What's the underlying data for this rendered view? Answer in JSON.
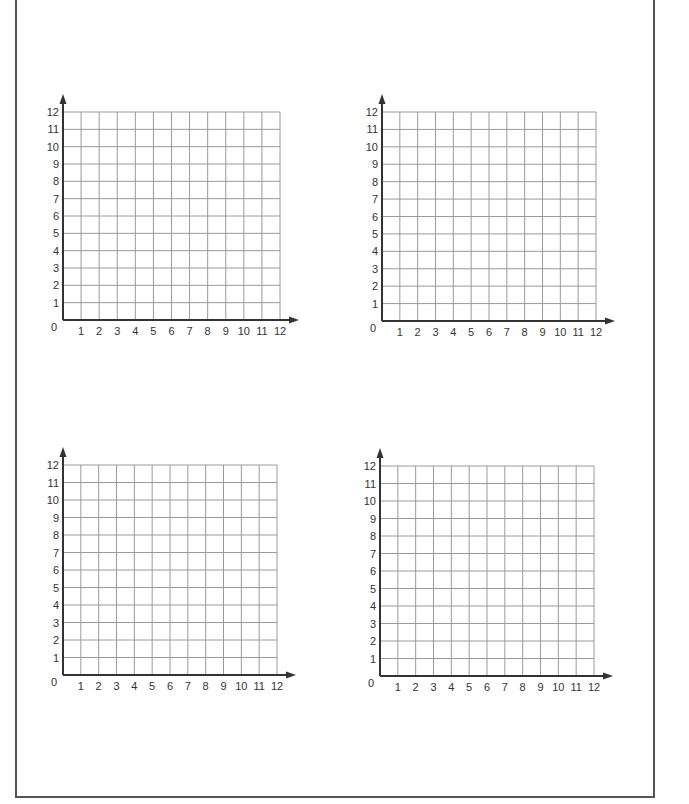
{
  "worksheet": {
    "grid_count": 4,
    "colors": {
      "grid_line": "#9a9a9a",
      "axis": "#333333",
      "frame": "#555555",
      "label": "#333333"
    },
    "grids": [
      {
        "id": "top-left",
        "origin_x": 63,
        "origin_y": 320,
        "width": 217,
        "height": 208,
        "x_labels": [
          "1",
          "2",
          "3",
          "4",
          "5",
          "6",
          "7",
          "8",
          "9",
          "10",
          "11",
          "12"
        ],
        "y_labels": [
          "1",
          "2",
          "3",
          "4",
          "5",
          "6",
          "7",
          "8",
          "9",
          "10",
          "11",
          "12"
        ],
        "origin_label": "0"
      },
      {
        "id": "top-right",
        "origin_x": 382,
        "origin_y": 321,
        "width": 214,
        "height": 209,
        "x_labels": [
          "1",
          "2",
          "3",
          "4",
          "5",
          "6",
          "7",
          "8",
          "9",
          "10",
          "11",
          "12"
        ],
        "y_labels": [
          "1",
          "2",
          "3",
          "4",
          "5",
          "6",
          "7",
          "8",
          "9",
          "10",
          "11",
          "12"
        ],
        "origin_label": "0"
      },
      {
        "id": "bottom-left",
        "origin_x": 63,
        "origin_y": 675,
        "width": 214,
        "height": 210,
        "x_labels": [
          "1",
          "2",
          "3",
          "4",
          "5",
          "6",
          "7",
          "8",
          "9",
          "10",
          "11",
          "12"
        ],
        "y_labels": [
          "1",
          "2",
          "3",
          "4",
          "5",
          "6",
          "7",
          "8",
          "9",
          "10",
          "11",
          "12"
        ],
        "origin_label": "0"
      },
      {
        "id": "bottom-right",
        "origin_x": 380,
        "origin_y": 676,
        "width": 214,
        "height": 210,
        "x_labels": [
          "1",
          "2",
          "3",
          "4",
          "5",
          "6",
          "7",
          "8",
          "9",
          "10",
          "11",
          "12"
        ],
        "y_labels": [
          "1",
          "2",
          "3",
          "4",
          "5",
          "6",
          "7",
          "8",
          "9",
          "10",
          "11",
          "12"
        ],
        "origin_label": "0"
      }
    ]
  }
}
